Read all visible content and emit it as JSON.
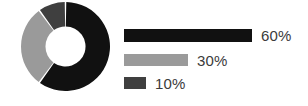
{
  "chart_data": {
    "type": "pie",
    "variant": "donut-with-bar-legend",
    "title": "",
    "subtitle": "",
    "xlabel": "",
    "ylabel": "",
    "legend_position": "right",
    "grid": false,
    "categories": [
      "60%",
      "30%",
      "10%"
    ],
    "values": [
      60,
      30,
      10
    ],
    "value_labels": [
      "60%",
      "30%",
      "10%"
    ],
    "colors": [
      "#111111",
      "#9a9a9a",
      "#3f3f3f"
    ],
    "donut": {
      "start_angle_deg": 0,
      "direction": "clockwise",
      "hole_ratio": 0.45,
      "gap_deg": 2,
      "segments": [
        {
          "label": "60%",
          "value": 60,
          "color": "#111111"
        },
        {
          "label": "30%",
          "value": 30,
          "color": "#9a9a9a"
        },
        {
          "label": "10%",
          "value": 10,
          "color": "#3f3f3f"
        }
      ]
    },
    "bars": {
      "max_value": 60,
      "max_width_px": 128,
      "items": [
        {
          "label": "60%",
          "value": 60,
          "color": "#111111",
          "width_px": 128
        },
        {
          "label": "30%",
          "value": 30,
          "color": "#9a9a9a",
          "width_px": 64
        },
        {
          "label": "10%",
          "value": 10,
          "color": "#3f3f3f",
          "width_px": 22
        }
      ]
    }
  },
  "figure": {
    "background": "#ffffff",
    "text_color": "#3b3b3b"
  }
}
